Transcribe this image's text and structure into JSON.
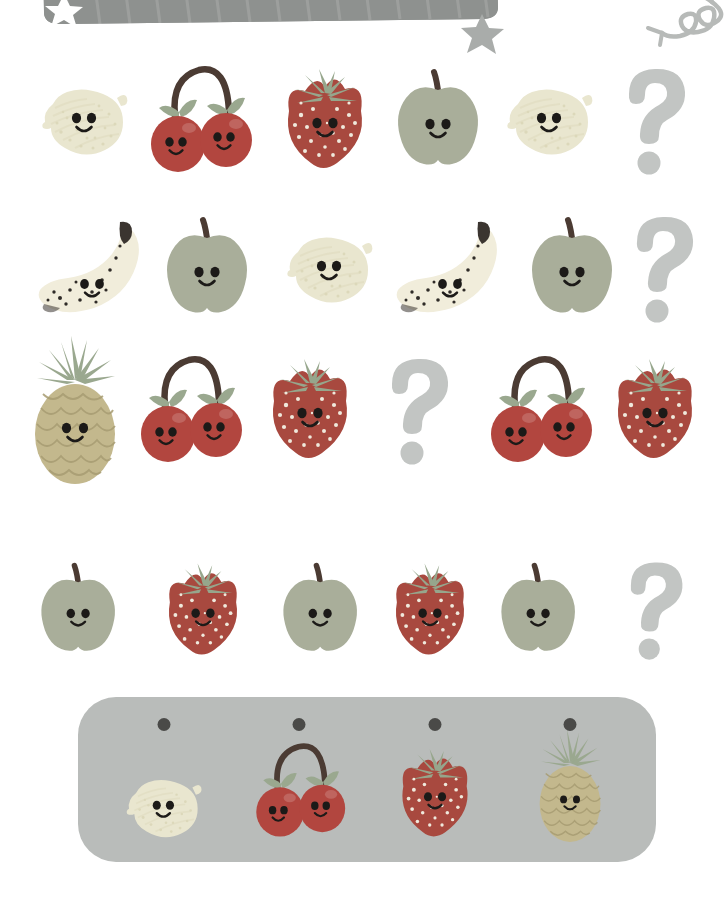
{
  "page": {
    "background_color": "#ffffff",
    "width": 728,
    "height": 912
  },
  "decorations": {
    "banner": {
      "name": "title-banner",
      "shape": "rounded-rectangle",
      "color": "#8e918f",
      "star_color": "#ffffff",
      "x": 38,
      "y": -40,
      "width": 460,
      "height": 58
    },
    "star": {
      "name": "star-decoration",
      "color": "#a9acaa",
      "x": 478,
      "y": 16
    },
    "curved_arrow": {
      "name": "curved-arrow-decoration",
      "color": "#b4b7b5",
      "description": "curved line with curly tail and arrowhead pointing left"
    }
  },
  "colors": {
    "lemon_body": "#e9e6cf",
    "lemon_shade": "#dcd8ba",
    "cherry_body": "#b2463f",
    "cherry_stem": "#4b3b33",
    "cherry_leaf": "#9aa88f",
    "strawberry_body": "#a8493f",
    "strawberry_leaf": "#96a68c",
    "strawberry_seed": "#efe9dc",
    "apple_body": "#a9ae9a",
    "apple_stem": "#4b3b33",
    "banana_body": "#f1eddb",
    "banana_tip": "#3b3530",
    "banana_spot": "#2f2b27",
    "pineapple_body": "#c3b88d",
    "pineapple_crown": "#9aa88f",
    "pineapple_line": "#a79c72",
    "question_mark": "#c2c5c3",
    "face": "#1c1a18",
    "answer_bank": "#b9bcba",
    "bank_dot": "#4a4a48"
  },
  "rows": [
    {
      "id": "row-1",
      "label": "Pattern row 1",
      "cells": [
        {
          "type": "lemon",
          "label": "lemon",
          "answer": false
        },
        {
          "type": "cherries",
          "label": "cherries",
          "answer": false
        },
        {
          "type": "strawberry",
          "label": "strawberry",
          "answer": false
        },
        {
          "type": "apple",
          "label": "apple",
          "answer": false
        },
        {
          "type": "lemon",
          "label": "lemon",
          "answer": false
        },
        {
          "type": "question",
          "label": "missing fruit",
          "answer": true
        }
      ]
    },
    {
      "id": "row-2",
      "label": "Pattern row 2",
      "cells": [
        {
          "type": "banana",
          "label": "banana",
          "answer": false
        },
        {
          "type": "apple",
          "label": "apple",
          "answer": false
        },
        {
          "type": "lemon",
          "label": "lemon",
          "answer": false
        },
        {
          "type": "banana",
          "label": "banana",
          "answer": false
        },
        {
          "type": "apple",
          "label": "apple",
          "answer": false
        },
        {
          "type": "question",
          "label": "missing fruit",
          "answer": true
        }
      ]
    },
    {
      "id": "row-3",
      "label": "Pattern row 3",
      "cells": [
        {
          "type": "pineapple",
          "label": "pineapple",
          "answer": false
        },
        {
          "type": "cherries",
          "label": "cherries",
          "answer": false
        },
        {
          "type": "strawberry",
          "label": "strawberry",
          "answer": false
        },
        {
          "type": "question",
          "label": "missing fruit",
          "answer": true
        },
        {
          "type": "cherries",
          "label": "cherries",
          "answer": false
        },
        {
          "type": "strawberry",
          "label": "strawberry",
          "answer": false
        }
      ]
    },
    {
      "id": "row-4",
      "label": "Pattern row 4",
      "cells": [
        {
          "type": "apple",
          "label": "apple",
          "answer": false
        },
        {
          "type": "strawberry",
          "label": "strawberry",
          "answer": false
        },
        {
          "type": "apple",
          "label": "apple",
          "answer": false
        },
        {
          "type": "strawberry",
          "label": "strawberry",
          "answer": false
        },
        {
          "type": "apple",
          "label": "apple",
          "answer": false
        },
        {
          "type": "question",
          "label": "missing fruit",
          "answer": true
        }
      ]
    }
  ],
  "answer_bank": {
    "label": "Answer choices",
    "background_color": "#b9bcba",
    "options": [
      {
        "type": "lemon",
        "label": "lemon",
        "marker": "dot"
      },
      {
        "type": "cherries",
        "label": "cherries",
        "marker": "dot"
      },
      {
        "type": "strawberry",
        "label": "strawberry",
        "marker": "dot"
      },
      {
        "type": "pineapple",
        "label": "pineapple",
        "marker": "dot"
      }
    ]
  }
}
